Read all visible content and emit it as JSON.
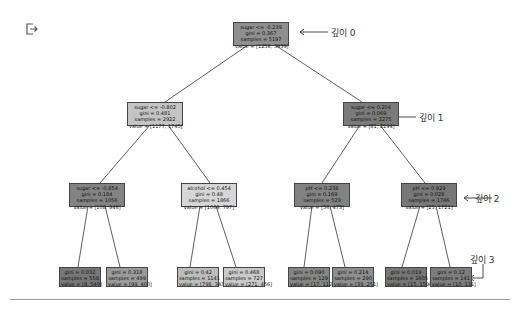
{
  "output_icon": "output-redirect-icon",
  "tree": {
    "nodes": [
      {
        "id": "root",
        "depth": 0,
        "cond": "sugar <= -0.239",
        "gini": "gini = 0.367",
        "samples": "samples = 5197",
        "value": "value = [1258, 3939]",
        "color": "#8f8f8f"
      },
      {
        "id": "d1-left",
        "depth": 1,
        "cond": "sugar <= -0.802",
        "gini": "gini = 0.481",
        "samples": "samples = 2922",
        "value": "value = [1177, 1745]",
        "color": "#c4c4c4"
      },
      {
        "id": "d1-right",
        "depth": 1,
        "cond": "sugar <= 0.204",
        "gini": "gini = 0.069",
        "samples": "samples = 2275",
        "value": "value = [81, 2194]",
        "color": "#7a7a7a"
      },
      {
        "id": "d2-a",
        "depth": 2,
        "cond": "sugar <= -0.854",
        "gini": "gini = 0.184",
        "samples": "samples = 1056",
        "value": "value = [108, 948]",
        "color": "#838383"
      },
      {
        "id": "d2-b",
        "depth": 2,
        "cond": "alcohol <= 0.454",
        "gini": "gini = 0.48",
        "samples": "samples = 1866",
        "value": "value = [1069, 797]",
        "color": "#d6d6d6"
      },
      {
        "id": "d2-c",
        "depth": 2,
        "cond": "pH <= 0.238",
        "gini": "gini = 0.169",
        "samples": "samples = 529",
        "value": "value = [56, 473]",
        "color": "#828282"
      },
      {
        "id": "d2-d",
        "depth": 2,
        "cond": "pH <= 0.929",
        "gini": "gini = 0.028",
        "samples": "samples = 1746",
        "value": "value = [25, 1721]",
        "color": "#777777"
      },
      {
        "id": "leaf-1",
        "depth": 3,
        "gini": "gini = 0.032",
        "samples": "samples = 558",
        "value": "value = [9, 549]",
        "color": "#777777"
      },
      {
        "id": "leaf-2",
        "depth": 3,
        "gini": "gini = 0.318",
        "samples": "samples = 499",
        "value": "value = [99, 400]",
        "color": "#9b9b9b"
      },
      {
        "id": "leaf-3",
        "depth": 3,
        "gini": "gini = 0.42",
        "samples": "samples = 1141",
        "value": "value = [798, 343]",
        "color": "#bdbdbd"
      },
      {
        "id": "leaf-4",
        "depth": 3,
        "gini": "gini = 0.468",
        "samples": "samples = 727",
        "value": "value = [271, 456]",
        "color": "#c9c9c9"
      },
      {
        "id": "leaf-5",
        "depth": 3,
        "gini": "gini = 0.090",
        "samples": "samples = 129",
        "value": "value = [17, 112]",
        "color": "#858585"
      },
      {
        "id": "leaf-6",
        "depth": 3,
        "gini": "gini = 0.214",
        "samples": "samples = 290",
        "value": "value = [39, 251]",
        "color": "#8e8e8e"
      },
      {
        "id": "leaf-7",
        "depth": 3,
        "gini": "gini = 0.019",
        "samples": "samples = 1605",
        "value": "value = [15, 1590]",
        "color": "#767676"
      },
      {
        "id": "leaf-8",
        "depth": 3,
        "gini": "gini = 0.12",
        "samples": "samples = 141",
        "value": "value = [10, 131]",
        "color": "#7d7d7d"
      }
    ]
  },
  "annotations": {
    "depth0": "깊이 0",
    "depth1": "깊이 1",
    "depth2": "깊이 2",
    "depth3": "깊이 3"
  }
}
